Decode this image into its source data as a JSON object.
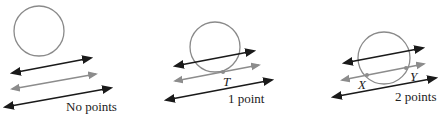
{
  "figure": {
    "colors": {
      "circle": "#8a8a8a",
      "line_dark": "#1a1a1a",
      "line_gray": "#8c8c8c",
      "point": "#8c8c8c",
      "text": "#222222"
    },
    "panels": [
      {
        "caption": "No points",
        "points": []
      },
      {
        "caption": "1 point",
        "points": [
          {
            "label": "T"
          }
        ]
      },
      {
        "caption": "2 points",
        "points": [
          {
            "label": "X"
          },
          {
            "label": "Y"
          }
        ]
      }
    ]
  }
}
